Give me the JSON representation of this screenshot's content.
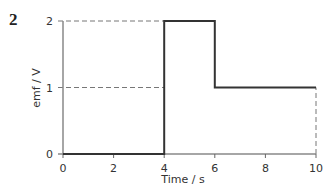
{
  "question_number": "2",
  "chart_data": {
    "type": "line",
    "style": "step",
    "title": "",
    "xlabel": "Time / s",
    "ylabel": "emf / V",
    "xlim": [
      0,
      10
    ],
    "ylim": [
      0,
      2
    ],
    "x_ticks": [
      "0",
      "2",
      "4",
      "6",
      "8",
      "10"
    ],
    "y_ticks": [
      "0",
      "1",
      "2"
    ],
    "grid": false,
    "reference_lines": [
      {
        "type": "horizontal-dashed",
        "y": 2,
        "from_x": 0,
        "to_x": 4
      },
      {
        "type": "horizontal-dashed",
        "y": 1,
        "from_x": 0,
        "to_x": 4
      },
      {
        "type": "vertical-dashed",
        "x": 10,
        "from_y": 0,
        "to_y": 1
      }
    ],
    "series": [
      {
        "name": "emf",
        "x": [
          0,
          4,
          4,
          6,
          6,
          10
        ],
        "y": [
          0,
          0,
          2,
          2,
          1,
          1
        ]
      }
    ]
  }
}
